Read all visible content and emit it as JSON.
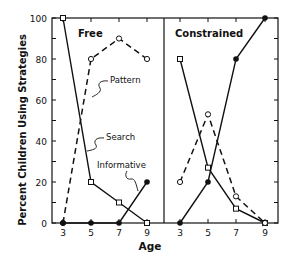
{
  "chart_data": [
    {
      "type": "line",
      "title": "Free",
      "xlabel": "Age",
      "ylabel": "Percent Children Using Strategies",
      "x": [
        3,
        5,
        7,
        9
      ],
      "ylim": [
        0,
        100
      ],
      "yticks": [
        0,
        20,
        40,
        60,
        80,
        100
      ],
      "series": [
        {
          "name": "Search",
          "style": "solid, open square",
          "values": [
            100,
            20,
            10,
            0
          ]
        },
        {
          "name": "Pattern",
          "style": "dashed, open circle",
          "values": [
            0,
            80,
            90,
            80
          ]
        },
        {
          "name": "Informative",
          "style": "solid, filled circle",
          "values": [
            0,
            0,
            0,
            20
          ]
        }
      ],
      "annotations": [
        "Pattern",
        "Search",
        "Informative"
      ]
    },
    {
      "type": "line",
      "title": "Constrained",
      "xlabel": "Age",
      "x": [
        3,
        5,
        7,
        9
      ],
      "ylim": [
        0,
        100
      ],
      "series": [
        {
          "name": "Search",
          "style": "solid, open square",
          "values": [
            80,
            27,
            7,
            0
          ]
        },
        {
          "name": "Pattern",
          "style": "dashed, open circle",
          "values": [
            20,
            53,
            13,
            0
          ]
        },
        {
          "name": "Informative",
          "style": "solid, filled circle",
          "values": [
            0,
            20,
            80,
            100
          ]
        }
      ]
    }
  ],
  "labels": {
    "ylabel": "Percent Children Using Strategies",
    "xlabel": "Age",
    "panel_free": "Free",
    "panel_constrained": "Constrained",
    "ann_pattern": "Pattern",
    "ann_search": "Search",
    "ann_informative": "Informative",
    "yticks": [
      "0",
      "20",
      "40",
      "60",
      "80",
      "100"
    ],
    "xticks": [
      "3",
      "5",
      "7",
      "9"
    ]
  }
}
